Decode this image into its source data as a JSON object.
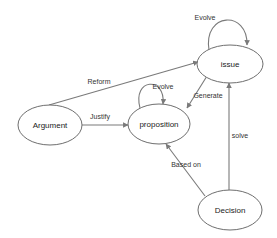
{
  "diagram": {
    "type": "state-relationship-diagram",
    "nodes": [
      {
        "id": "issue",
        "label": "issue"
      },
      {
        "id": "proposition",
        "label": "proposition"
      },
      {
        "id": "argument",
        "label": "Argument"
      },
      {
        "id": "decision",
        "label": "Decision"
      }
    ],
    "edges": [
      {
        "from": "issue",
        "to": "issue",
        "label": "Evolve"
      },
      {
        "from": "argument",
        "to": "issue",
        "label": "Reform"
      },
      {
        "from": "proposition",
        "to": "proposition",
        "label": "Evolve"
      },
      {
        "from": "issue",
        "to": "proposition",
        "label": "Generate"
      },
      {
        "from": "argument",
        "to": "proposition",
        "label": "Justify"
      },
      {
        "from": "decision",
        "to": "issue",
        "label": "solve"
      },
      {
        "from": "decision",
        "to": "proposition",
        "label": "Based on"
      }
    ],
    "colors": {
      "stroke": "#6e6e6e",
      "background": "#ffffff",
      "text": "#222222"
    }
  }
}
